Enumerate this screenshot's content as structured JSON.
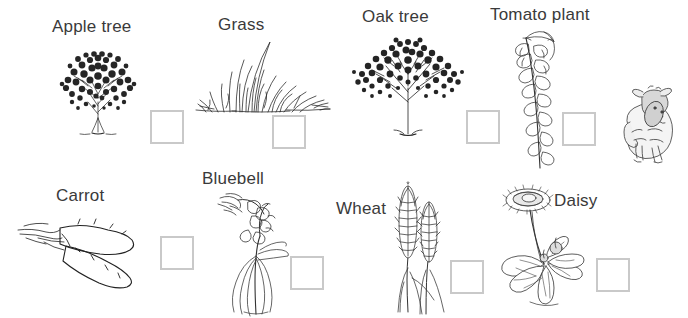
{
  "worksheet": {
    "background_color": "#ffffff",
    "label_color": "#3a3a3a",
    "checkbox_border_color": "#c9c9c9",
    "ink_color": "#222222"
  },
  "items": [
    {
      "id": "apple-tree",
      "label": "Apple tree",
      "icon": "apple-tree-drawing",
      "label_x": 52,
      "label_y": 18,
      "art_x": 48,
      "art_y": 36,
      "box_x": 150,
      "box_y": 110,
      "box_size": 34
    },
    {
      "id": "grass",
      "label": "Grass",
      "icon": "grass-drawing",
      "label_x": 218,
      "label_y": 16,
      "art_x": 196,
      "art_y": 34,
      "box_x": 272,
      "box_y": 115,
      "box_size": 34
    },
    {
      "id": "oak-tree",
      "label": "Oak tree",
      "icon": "oak-tree-drawing",
      "label_x": 362,
      "label_y": 8,
      "art_x": 350,
      "art_y": 28,
      "box_x": 466,
      "box_y": 110,
      "box_size": 34
    },
    {
      "id": "tomato-plant",
      "label": "Tomato plant",
      "icon": "tomato-plant-drawing",
      "label_x": 490,
      "label_y": 6,
      "art_x": 504,
      "art_y": 24,
      "box_x": 562,
      "box_y": 112,
      "box_size": 34
    },
    {
      "id": "carrot",
      "label": "Carrot",
      "icon": "carrot-drawing",
      "label_x": 56,
      "label_y": 187,
      "art_x": 18,
      "art_y": 212,
      "box_x": 160,
      "box_y": 236,
      "box_size": 34
    },
    {
      "id": "bluebell",
      "label": "Bluebell",
      "icon": "bluebell-drawing",
      "label_x": 202,
      "label_y": 170,
      "art_x": 218,
      "art_y": 192,
      "box_x": 290,
      "box_y": 256,
      "box_size": 34
    },
    {
      "id": "wheat",
      "label": "Wheat",
      "icon": "wheat-drawing",
      "label_x": 336,
      "label_y": 200,
      "art_x": 392,
      "art_y": 182,
      "box_x": 450,
      "box_y": 260,
      "box_size": 34
    },
    {
      "id": "daisy",
      "label": "Daisy",
      "icon": "daisy-drawing",
      "label_x": 554,
      "label_y": 192,
      "art_x": 490,
      "art_y": 186,
      "box_x": 596,
      "box_y": 258,
      "box_size": 34
    }
  ],
  "decorations": [
    {
      "id": "sheep",
      "icon": "sheep-drawing",
      "art_x": 608,
      "art_y": 86
    }
  ]
}
